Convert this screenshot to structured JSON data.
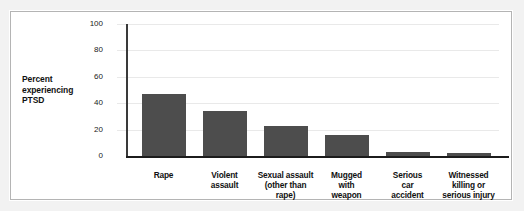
{
  "figure": {
    "background_color": "#ffffff",
    "border_color": "#b4b4b4",
    "page_color": "#f2f2f2"
  },
  "axis_label": {
    "line1": "Percent",
    "line2": "experiencing",
    "line3": "PTSD"
  },
  "chart_data": {
    "type": "bar",
    "title": "",
    "xlabel": "",
    "ylabel": "Percent experiencing PTSD",
    "ylim": [
      0,
      100
    ],
    "yticks": [
      0,
      20,
      40,
      60,
      80,
      100
    ],
    "ytick_labels": [
      "0",
      "20",
      "40",
      "60",
      "80",
      "100"
    ],
    "grid": true,
    "legend": false,
    "bar_color": "#4d4d4d",
    "categories": [
      "Rape",
      "Violent assault",
      "Sexual assault (other than rape)",
      "Mugged with weapon",
      "Serious car accident",
      "Witnessed killing or serious injury"
    ],
    "category_lines": [
      [
        "Rape"
      ],
      [
        "Violent",
        "assault"
      ],
      [
        "Sexual assault",
        "(other than",
        "rape)"
      ],
      [
        "Mugged",
        "with",
        "weapon"
      ],
      [
        "Serious",
        "car",
        "accident"
      ],
      [
        "Witnessed",
        "killing or",
        "serious injury"
      ]
    ],
    "values": [
      47,
      34,
      23,
      16,
      3,
      2
    ]
  }
}
